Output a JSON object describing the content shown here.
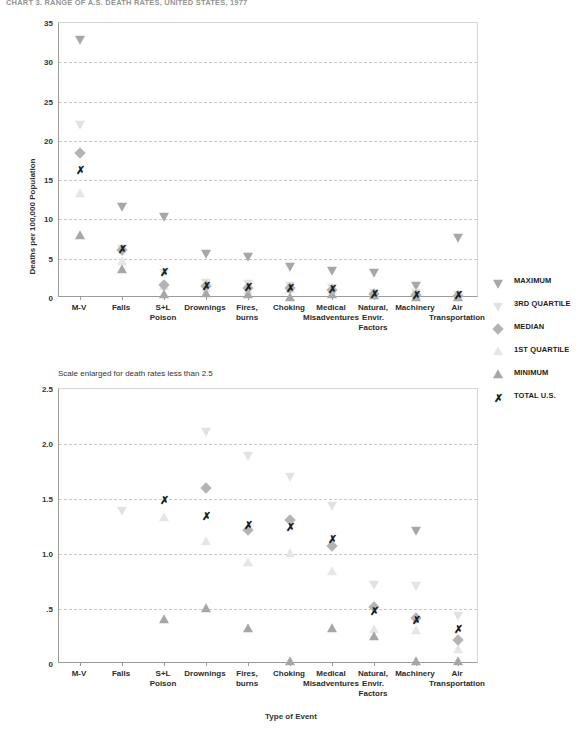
{
  "title": "CHART 3. RANGE OF A.S. DEATH RATES, UNITED STATES, 1977",
  "subnote": "Scale enlarged for death rates less than 2.5",
  "axis": {
    "ylabel": "Deaths per 100,000 Population",
    "xlabel": "Type of Event"
  },
  "legend": [
    {
      "symbol": "filled-down-triangle",
      "label": "MAXIMUM"
    },
    {
      "symbol": "hollow-down-triangle",
      "label": "3RD QUARTILE"
    },
    {
      "symbol": "diamond",
      "label": "MEDIAN"
    },
    {
      "symbol": "hollow-up-triangle",
      "label": "1ST QUARTILE"
    },
    {
      "symbol": "filled-up-triangle",
      "label": "MINIMUM"
    },
    {
      "symbol": "x-glyph",
      "label": "TOTAL U.S."
    }
  ],
  "categories": [
    {
      "line1": "M-V",
      "line2": "",
      "line3": ""
    },
    {
      "line1": "Falls",
      "line2": "",
      "line3": ""
    },
    {
      "line1": "S+L",
      "line2": "Poison",
      "line3": ""
    },
    {
      "line1": "Drownings",
      "line2": "",
      "line3": ""
    },
    {
      "line1": "Fires,",
      "line2": "burns",
      "line3": ""
    },
    {
      "line1": "Choking",
      "line2": "",
      "line3": ""
    },
    {
      "line1": "Medical",
      "line2": "Misadventures",
      "line3": ""
    },
    {
      "line1": "Natural,",
      "line2": "Envir.",
      "line3": "Factors"
    },
    {
      "line1": "Machinery",
      "line2": "",
      "line3": ""
    },
    {
      "line1": "Air",
      "line2": "Transportation",
      "line3": ""
    }
  ],
  "chart_data": [
    {
      "type": "scatter",
      "id": "top",
      "title": "CHART 3. RANGE OF A.S. DEATH RATES, UNITED STATES, 1977",
      "xlabel": "Type of Event",
      "ylabel": "Deaths per 100,000 Population",
      "ylim": [
        0,
        35
      ],
      "yticks": [
        0,
        5,
        10,
        15,
        20,
        25,
        30,
        35
      ],
      "ytick_labels": [
        "0",
        "5",
        "10",
        "15",
        "20",
        "25",
        "30",
        "35"
      ],
      "grid": true,
      "categories": [
        "M-V",
        "Falls",
        "S+L Poison",
        "Drownings",
        "Fires, burns",
        "Choking",
        "Medical Misadventures",
        "Natural, Envir. Factors",
        "Machinery",
        "Air Transportation"
      ],
      "series": [
        {
          "name": "MAXIMUM",
          "values": [
            33.0,
            11.7,
            10.5,
            5.7,
            5.3,
            4.1,
            3.6,
            3.3,
            1.6,
            7.8
          ]
        },
        {
          "name": "3RD QUARTILE",
          "values": [
            22.2,
            6.4,
            3.3,
            2.1,
            1.9,
            1.7,
            1.4,
            0.75,
            0.75,
            0.45
          ]
        },
        {
          "name": "MEDIAN",
          "values": [
            18.4,
            6.1,
            1.6,
            1.5,
            1.25,
            1.3,
            1.05,
            0.5,
            0.42,
            0.22
          ]
        },
        {
          "name": "1ST QUARTILE",
          "values": [
            13.3,
            4.6,
            1.4,
            1.1,
            0.92,
            1.0,
            0.85,
            0.32,
            0.3,
            0.13
          ]
        },
        {
          "name": "MINIMUM",
          "values": [
            7.9,
            3.6,
            0.4,
            0.5,
            0.32,
            0.03,
            0.32,
            0.25,
            0.03,
            0.02
          ]
        },
        {
          "name": "TOTAL U.S.",
          "values": [
            16.3,
            6.2,
            3.3,
            1.5,
            1.35,
            1.25,
            1.2,
            0.48,
            0.4,
            0.32
          ]
        }
      ]
    },
    {
      "type": "scatter",
      "id": "bottom",
      "title": "Scale enlarged for death rates less than 2.5",
      "xlabel": "Type of Event",
      "ylabel": "Deaths per 100,000 Population",
      "ylim": [
        0,
        2.5
      ],
      "yticks": [
        0,
        0.5,
        1.0,
        1.5,
        2.0,
        2.5
      ],
      "ytick_labels": [
        "0",
        ".5",
        "1.0",
        "1.5",
        "2.0",
        "2.5"
      ],
      "grid": true,
      "categories": [
        "M-V",
        "Falls",
        "S+L Poison",
        "Drownings",
        "Fires, burns",
        "Choking",
        "Medical Misadventures",
        "Natural, Envir. Factors",
        "Machinery",
        "Air Transportation"
      ],
      "series": [
        {
          "name": "MAXIMUM",
          "values": [
            null,
            null,
            null,
            null,
            null,
            null,
            null,
            null,
            1.22,
            null
          ]
        },
        {
          "name": "3RD QUARTILE",
          "values": [
            null,
            1.4,
            null,
            2.12,
            1.9,
            1.71,
            1.45,
            0.73,
            0.72,
            0.45
          ]
        },
        {
          "name": "MEDIAN",
          "values": [
            null,
            null,
            null,
            1.6,
            1.22,
            1.31,
            1.07,
            0.52,
            0.42,
            0.22
          ]
        },
        {
          "name": "1ST QUARTILE",
          "values": [
            null,
            null,
            1.33,
            1.11,
            0.92,
            1.0,
            0.84,
            0.31,
            0.3,
            0.13
          ]
        },
        {
          "name": "MINIMUM",
          "values": [
            null,
            null,
            0.4,
            0.5,
            0.32,
            0.02,
            0.32,
            0.25,
            0.02,
            0.02
          ]
        },
        {
          "name": "TOTAL U.S.",
          "values": [
            null,
            null,
            1.49,
            1.35,
            1.26,
            1.25,
            1.14,
            0.48,
            0.4,
            0.32
          ]
        }
      ]
    }
  ]
}
